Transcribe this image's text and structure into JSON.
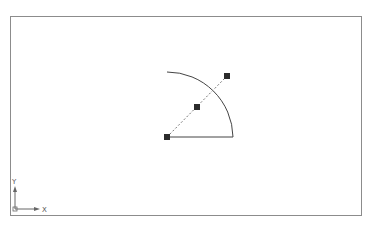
{
  "canvas": {
    "background": "#ffffff",
    "frame_color": "#8c8c8c",
    "entity_color": "#333333",
    "grip_color": "#2b2b2b"
  },
  "drawing": {
    "arc": {
      "cx": 167,
      "cy": 137,
      "radius": 66,
      "start": [
        167,
        72
      ],
      "end": [
        233,
        137
      ]
    },
    "baseline": {
      "from": [
        167,
        137
      ],
      "to": [
        233,
        137
      ]
    },
    "radius_line": {
      "from": [
        167,
        137
      ],
      "to": [
        227,
        76
      ],
      "style": "dashed"
    },
    "grips": [
      {
        "name": "center-grip",
        "x": 167,
        "y": 137
      },
      {
        "name": "midpoint-grip",
        "x": 197,
        "y": 107
      },
      {
        "name": "endpoint-grip",
        "x": 227,
        "y": 76
      }
    ]
  },
  "ucs": {
    "x_label": "X",
    "y_label": "Y"
  }
}
